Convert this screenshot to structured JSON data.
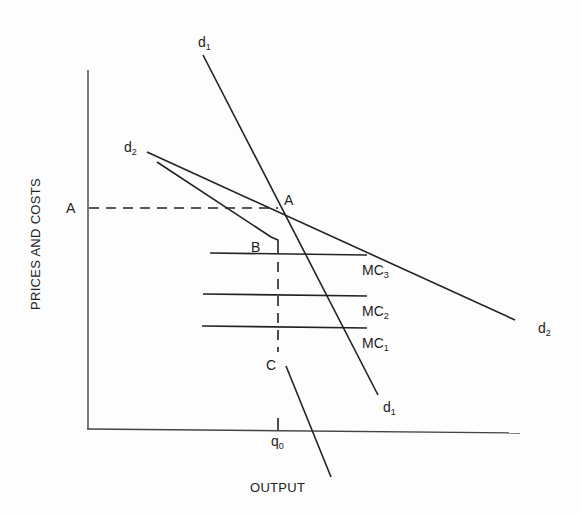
{
  "diagram": {
    "y_axis_title": "PRICES AND COSTS",
    "x_axis_title": "OUTPUT",
    "price_level_label": "A",
    "point_labels": {
      "A": "A",
      "B": "B",
      "C": "C"
    },
    "quantity_label": {
      "main": "q",
      "sub": "0"
    },
    "curves": {
      "d1_top": {
        "main": "d",
        "sub": "1"
      },
      "d1_bottom": {
        "main": "d",
        "sub": "1"
      },
      "d2_top": {
        "main": "d",
        "sub": "2"
      },
      "d2_bottom": {
        "main": "d",
        "sub": "2"
      },
      "mc3": {
        "main": "MC",
        "sub": "3"
      },
      "mc2": {
        "main": "MC",
        "sub": "2"
      },
      "mc1": {
        "main": "MC",
        "sub": "1"
      }
    }
  }
}
